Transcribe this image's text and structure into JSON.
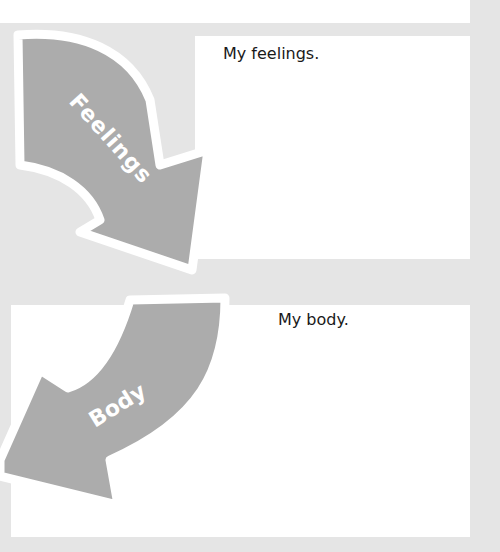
{
  "worksheet": {
    "sections": [
      {
        "arrow_label": "Feelings",
        "prompt": "My feelings."
      },
      {
        "arrow_label": "Body",
        "prompt": "My body."
      }
    ],
    "colors": {
      "background": "#e5e5e5",
      "box": "#ffffff",
      "arrow_fill": "#acacac",
      "arrow_outline": "#ffffff",
      "text": "#1a1a1a"
    }
  }
}
